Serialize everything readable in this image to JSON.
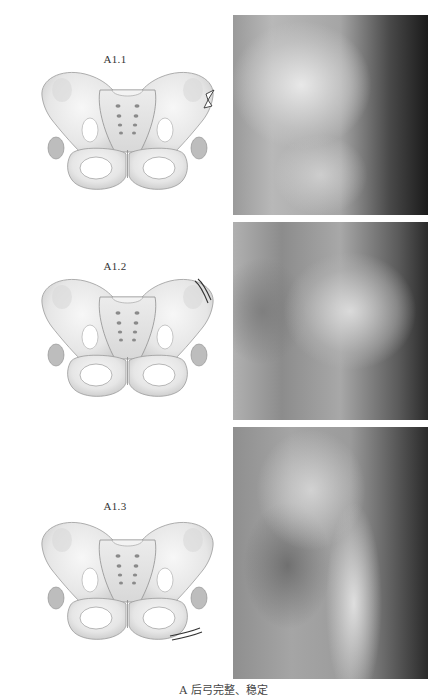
{
  "figure": {
    "caption": "A 后弓完整、稳定",
    "panels": [
      {
        "label": "A1.1",
        "fracture_site": "iliac wing (right side of drawing)",
        "xray_alt": "X-ray of hemipelvis, A1.1"
      },
      {
        "label": "A1.2",
        "fracture_site": "iliac crest (right side of drawing)",
        "xray_alt": "X-ray of hemipelvis, A1.2"
      },
      {
        "label": "A1.3",
        "fracture_site": "pubic ramus / ischium (lower right of drawing)",
        "xray_alt": "X-ray of hemipelvis, A1.3"
      }
    ]
  }
}
